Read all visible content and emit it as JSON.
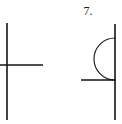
{
  "page": {
    "background_color": "#ffffff",
    "ink_color": "#141414",
    "width": 122,
    "height": 124
  },
  "label": {
    "number": "7."
  },
  "figures": [
    {
      "id": "left-figure",
      "name": "cross-figure",
      "description": "vertical line crossed by a horizontal line",
      "elements": [
        {
          "name": "vertical-line",
          "type": "line",
          "x1": 7,
          "y1": 23,
          "x2": 7,
          "y2": 120,
          "stroke_width": 1.6
        },
        {
          "name": "horizontal-line",
          "type": "line",
          "x1": 0,
          "y1": 65,
          "x2": 43,
          "y2": 65,
          "stroke_width": 1.4
        }
      ]
    },
    {
      "id": "right-figure",
      "name": "semicircle-on-line-figure",
      "description": "vertical line with a left-bulging semicircular arc, and a horizontal line meeting the vertical line",
      "elements": [
        {
          "name": "vertical-line",
          "type": "line",
          "x1": 115,
          "y1": 24,
          "x2": 115,
          "y2": 120,
          "stroke_width": 1.6
        },
        {
          "name": "horizontal-line",
          "type": "line",
          "x1": 81,
          "y1": 80,
          "x2": 116,
          "y2": 80,
          "stroke_width": 1.4
        },
        {
          "name": "semicircle-arc",
          "type": "arc",
          "center_x": 115,
          "center_y": 59,
          "radius": 21,
          "opens": "right",
          "bulges": "left",
          "start_x": 115,
          "start_y": 38,
          "end_x": 115,
          "end_y": 80,
          "stroke_width": 1.15
        }
      ]
    }
  ]
}
